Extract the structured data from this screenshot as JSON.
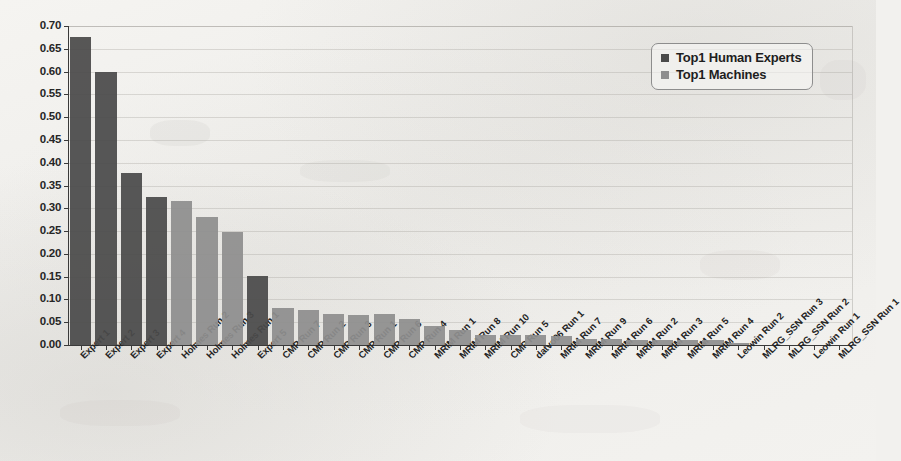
{
  "chart_data": {
    "type": "bar",
    "title": "",
    "xlabel": "",
    "ylabel": "",
    "ylim": [
      0.0,
      0.7
    ],
    "ytick_step": 0.05,
    "grid": true,
    "legend_position": "top-right",
    "yticks": [
      "0.70",
      "0.65",
      "0.60",
      "0.55",
      "0.50",
      "0.45",
      "0.40",
      "0.35",
      "0.30",
      "0.25",
      "0.20",
      "0.15",
      "0.10",
      "0.05",
      "0.00"
    ],
    "legend": [
      {
        "label": "Top1 Human Experts",
        "color": "#4a4a4a"
      },
      {
        "label": "Top1 Machines",
        "color": "#8e8e8e"
      }
    ],
    "categories": [
      "Expert 1",
      "Expert 2",
      "Expert 3",
      "Expert 4",
      "Holmes Run 2",
      "Holmes Run 3",
      "Holmes Run 1",
      "Expert 5",
      "CMP Run 7",
      "CMP Run 2",
      "CMP Run 3",
      "CMP Run 1",
      "CMP Run 6",
      "CMP Run 4",
      "MRIM Run 1",
      "MRIM Run 8",
      "MRIM Run 10",
      "CMP Run 5",
      "datvo06 Run 1",
      "MRIM Run 7",
      "MRIM Run 9",
      "MRIM Run 6",
      "MRIM Run 2",
      "MRIM Run 3",
      "MRIM Run 5",
      "MRIM Run 4",
      "Leowin Run 2",
      "MLRG_SSN Run 3",
      "MLRG_SSN Run 2",
      "Leowin Run 1",
      "MLRG_SSN Run 1"
    ],
    "values": [
      0.675,
      0.6,
      0.377,
      0.325,
      0.317,
      0.281,
      0.247,
      0.152,
      0.082,
      0.077,
      0.068,
      0.066,
      0.068,
      0.057,
      0.042,
      0.034,
      0.023,
      0.021,
      0.021,
      0.019,
      0.013,
      0.013,
      0.012,
      0.012,
      0.012,
      0.011,
      0.004,
      0.0,
      0.0,
      0.0,
      0.0
    ],
    "series_of": [
      "human",
      "human",
      "human",
      "human",
      "machine",
      "machine",
      "machine",
      "human",
      "machine",
      "machine",
      "machine",
      "machine",
      "machine",
      "machine",
      "machine",
      "machine",
      "machine",
      "machine",
      "machine",
      "machine",
      "machine",
      "machine",
      "machine",
      "machine",
      "machine",
      "machine",
      "machine",
      "machine",
      "machine",
      "machine",
      "machine"
    ]
  }
}
